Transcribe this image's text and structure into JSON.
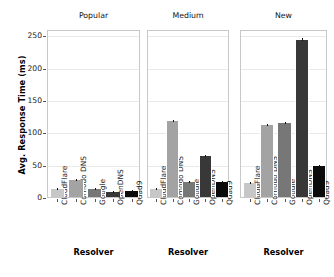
{
  "chart_data": {
    "type": "bar",
    "title": "",
    "xlabel": "Resolver",
    "ylabel": "Avg. Response Time (ms)",
    "ylim": [
      0,
      260
    ],
    "yticks": [
      0,
      50,
      100,
      150,
      200,
      250
    ],
    "ytick_labels": [
      "0",
      "50",
      "100",
      "150",
      "200",
      "250"
    ],
    "grid": true,
    "legend": "none",
    "categories": [
      "CloudFlare",
      "Comodo DNS",
      "Google",
      "OpenDNS",
      "Quad9"
    ],
    "panels": [
      {
        "title": "Popular",
        "xlabel": "Resolver",
        "values": [
          13,
          27,
          13,
          7,
          9
        ],
        "errors": [
          0.5,
          0.6,
          0.4,
          0.3,
          0.4
        ]
      },
      {
        "title": "Medium",
        "xlabel": "Resolver",
        "values": [
          13,
          118,
          23,
          63,
          23
        ],
        "errors": [
          0.6,
          1.2,
          0.7,
          1.0,
          0.7
        ]
      },
      {
        "title": "New",
        "xlabel": "Resolver",
        "values": [
          22,
          112,
          115,
          243,
          48
        ],
        "errors": [
          0.8,
          1.4,
          1.3,
          2.0,
          1.0
        ]
      }
    ],
    "bar_colors": [
      "#c7c7c7",
      "#a3a3a3",
      "#777777",
      "#383838",
      "#0b0b0b"
    ],
    "bar_edge_color": "#ffffff",
    "grid_color": "#e9e9e9",
    "axes_color": "#c9c9c9"
  }
}
